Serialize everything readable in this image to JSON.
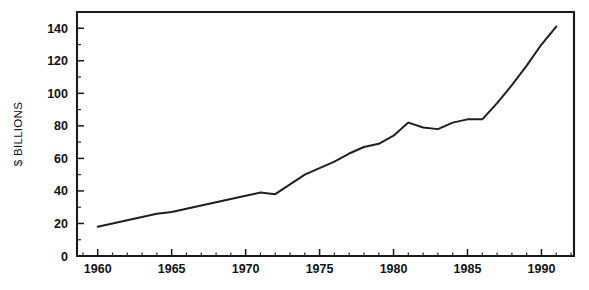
{
  "chart_data": {
    "type": "line",
    "title": "",
    "xlabel": "",
    "ylabel": "$ BILLIONS",
    "xlim": [
      1958.6,
      1992.2
    ],
    "ylim": [
      0,
      150
    ],
    "grid": false,
    "legend": null,
    "y_ticks": [
      0,
      20,
      40,
      60,
      80,
      100,
      120,
      140
    ],
    "y_tick_labels": [
      "0",
      "20",
      "40",
      "60",
      "80",
      "100",
      "120",
      "140"
    ],
    "x_ticks": [
      1960,
      1965,
      1970,
      1975,
      1980,
      1985,
      1990
    ],
    "x_tick_labels": [
      "1960",
      "1965",
      "1970",
      "1975",
      "1980",
      "1985",
      "1990"
    ],
    "x_minor_step": 1,
    "y_minor_step": 10,
    "line_color": "#1f1f1f",
    "series": [
      {
        "name": "Value",
        "x": [
          1960,
          1961,
          1962,
          1963,
          1964,
          1965,
          1966,
          1967,
          1968,
          1969,
          1970,
          1971,
          1972,
          1973,
          1974,
          1975,
          1976,
          1977,
          1978,
          1979,
          1980,
          1981,
          1982,
          1983,
          1984,
          1985,
          1986,
          1987,
          1988,
          1989,
          1990,
          1991
        ],
        "values": [
          18,
          20,
          22,
          24,
          26,
          27,
          29,
          31,
          33,
          35,
          37,
          39,
          38,
          44,
          50,
          54,
          58,
          63,
          67,
          69,
          74,
          82,
          79,
          78,
          82,
          84,
          84,
          94,
          105,
          117,
          130,
          141
        ]
      }
    ]
  },
  "ylabel_text": "$ BILLIONS"
}
